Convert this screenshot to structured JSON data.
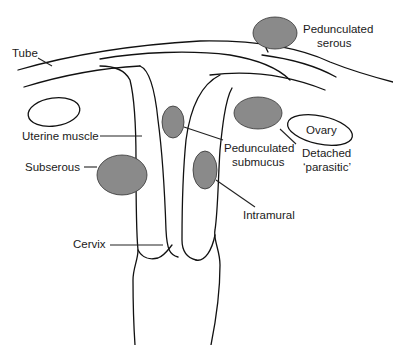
{
  "figure": {
    "type": "anatomical diagram",
    "fibroid_color": "#8a8a8a",
    "outline_color": "#111111"
  },
  "labels": {
    "tube": "Tube",
    "pedunculated_serous_1": "Pedunculated",
    "pedunculated_serous_2": "serous",
    "uterine_muscle": "Uterine muscle",
    "subserous": "Subserous",
    "pedunculated_submucus_1": "Pedunculated",
    "pedunculated_submucus_2": "submucus",
    "ovary": "Ovary",
    "detached_1": "Detached",
    "detached_2": "‘parasitic’",
    "intramural": "Intramural",
    "cervix": "Cervix"
  }
}
